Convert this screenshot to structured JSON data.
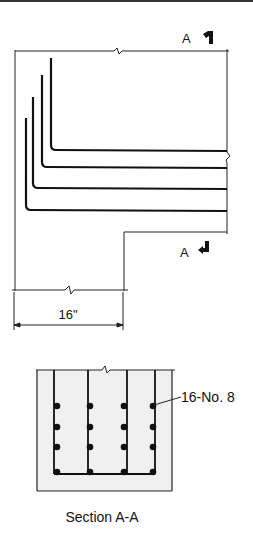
{
  "diagram": {
    "top_rule": true,
    "elevation": {
      "section_mark_top": {
        "letter": "A",
        "icon": "section-arrow-up-icon"
      },
      "section_mark_bottom": {
        "letter": "A",
        "icon": "section-arrow-down-icon"
      },
      "bar_count_shown": 4,
      "dimension": {
        "label": "16\""
      }
    },
    "section": {
      "bar_label": "16-No. 8",
      "title": "Section A-A",
      "rows": 4,
      "columns": 4,
      "concrete_fill": "#f0f0f0"
    },
    "colors": {
      "line": "#111111",
      "background": "#ffffff"
    }
  }
}
